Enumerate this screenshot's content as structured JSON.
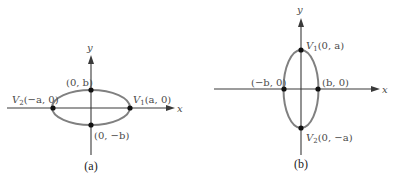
{
  "panels": [
    {
      "caption": "(a)",
      "axis_x_label": "x",
      "axis_y_label": "y",
      "orientation": "horizontal major axis",
      "points": {
        "top": "(0, b)",
        "bottom": "(0, −b)",
        "left_prefix": "V",
        "left_sub": "2",
        "left_coord": "(−a, 0)",
        "right_prefix": "V",
        "right_sub": "1",
        "right_coord": "(a, 0)"
      }
    },
    {
      "caption": "(b)",
      "axis_x_label": "x",
      "axis_y_label": "y",
      "orientation": "vertical major axis",
      "points": {
        "top_prefix": "V",
        "top_sub": "1",
        "top_coord": "(0, a)",
        "bottom_prefix": "V",
        "bottom_sub": "2",
        "bottom_coord": "(0, −a)",
        "left": "(−b, 0)",
        "right": "(b, 0)"
      }
    }
  ],
  "colors": {
    "axis": "#3a3a3a",
    "ellipse": "#808080",
    "point": "#111111",
    "label": "#4a4a4a"
  }
}
